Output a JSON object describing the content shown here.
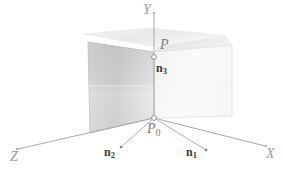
{
  "figure": {
    "type": "3d-geometry-diagram",
    "background_color": "#ffffff",
    "width": 283,
    "height": 177
  },
  "axes": {
    "origin_label": "P",
    "origin_sub": "0",
    "items": [
      {
        "name": "y-axis",
        "label": "Y",
        "tip": {
          "x": 154,
          "y": 12
        },
        "color": "#a8a8a8"
      },
      {
        "name": "x-axis",
        "label": "X",
        "tip": {
          "x": 266,
          "y": 145
        },
        "color": "#a8a8a8"
      },
      {
        "name": "z-axis",
        "label": "Z",
        "tip": {
          "x": 17,
          "y": 148
        },
        "color": "#a8a8a8"
      }
    ]
  },
  "points": [
    {
      "name": "point-p",
      "label": "P",
      "sub": "",
      "x": 154,
      "y": 57,
      "marker": "open-circle"
    },
    {
      "name": "point-p0",
      "label": "P",
      "sub": "0",
      "x": 154,
      "y": 118,
      "marker": "open-circle"
    }
  ],
  "vectors": [
    {
      "name": "normal-n1",
      "label": "n",
      "sub": "1",
      "dot": {
        "x": 206,
        "y": 150
      },
      "label_pos": {
        "x": 186,
        "y": 144
      }
    },
    {
      "name": "normal-n2",
      "label": "n",
      "sub": "2",
      "dot": {
        "x": 121,
        "y": 147
      },
      "label_pos": {
        "x": 104,
        "y": 144
      }
    },
    {
      "name": "normal-n3",
      "label": "n",
      "sub": "3",
      "dot": null,
      "label_pos": {
        "x": 156,
        "y": 62
      }
    }
  ],
  "planes": [
    {
      "name": "plane-front-vertical",
      "shading": "gradient-gray",
      "fill_start": "#c9c9c9",
      "fill_end": "#ededed",
      "border": "#bdbdbd",
      "corners": [
        [
          88,
          42
        ],
        [
          154,
          52
        ],
        [
          154,
          118
        ],
        [
          90,
          133
        ]
      ]
    },
    {
      "name": "plane-right-vertical",
      "shading": "flat-light",
      "fill_start": "#f6f6f6",
      "fill_end": "#fbfbfb",
      "border": "#dcdcdc",
      "corners": [
        [
          154,
          52
        ],
        [
          231,
          46
        ],
        [
          231,
          115
        ],
        [
          154,
          118
        ]
      ]
    },
    {
      "name": "plane-horizontal-back",
      "shading": "flat-faint",
      "fill_start": "#f2f2f2",
      "fill_end": "#fafafa",
      "border": "#e4e4e4",
      "corners": [
        [
          84,
          34
        ],
        [
          150,
          28
        ],
        [
          226,
          36
        ],
        [
          158,
          47
        ]
      ]
    }
  ],
  "colors": {
    "axis_line": "#a8a8a8",
    "plane_edge": "#bdbdbd",
    "label_gray": "#8a8a8a",
    "vector_label": "#3c3c3c",
    "marker_stroke": "#8f8f8f",
    "marker_fill": "#ffffff"
  }
}
